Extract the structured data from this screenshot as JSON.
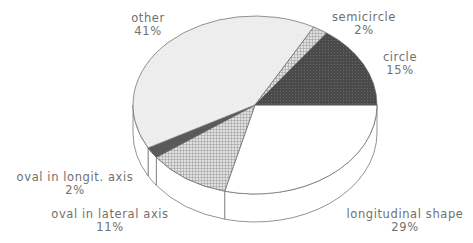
{
  "chart_data": {
    "type": "pie",
    "style": "3d-exploded-none",
    "title": "",
    "slices": [
      {
        "label": "longitudinal shape",
        "value": 29,
        "pct_label": "29%",
        "fill": "#ffffff",
        "pattern": "none"
      },
      {
        "label": "oval in lateral axis",
        "value": 11,
        "pct_label": "11%",
        "fill": "#c8c8c8",
        "pattern": "crosshatch"
      },
      {
        "label": "oval in longit. axis",
        "value": 2,
        "pct_label": "2%",
        "fill": "#5a5a5a",
        "pattern": "solid-dark"
      },
      {
        "label": "other",
        "value": 41,
        "pct_label": "41%",
        "fill": "#efefef",
        "pattern": "light-dots"
      },
      {
        "label": "semicircle",
        "value": 2,
        "pct_label": "2%",
        "fill": "#bdbdbd",
        "pattern": "crosshatch"
      },
      {
        "label": "circle",
        "value": 15,
        "pct_label": "15%",
        "fill": "#4e4e4e",
        "pattern": "dark-dots"
      }
    ],
    "start_angle_deg": 0,
    "direction": "clockwise",
    "geometry": {
      "cx": 255,
      "cy": 105,
      "rx": 122,
      "ry": 89,
      "depth": 28
    },
    "legend": "none (direct labels)"
  },
  "labels": {
    "other": {
      "name": "other",
      "pct": "41%"
    },
    "semicircle": {
      "name": "semicircle",
      "pct": "2%"
    },
    "circle": {
      "name": "circle",
      "pct": "15%"
    },
    "oval_longit": {
      "name": "oval in longit. axis",
      "pct": "2%"
    },
    "oval_lateral": {
      "name": "oval in lateral axis",
      "pct": "11%"
    },
    "longitudinal": {
      "name": "longitudinal shape",
      "pct": "29%"
    }
  }
}
